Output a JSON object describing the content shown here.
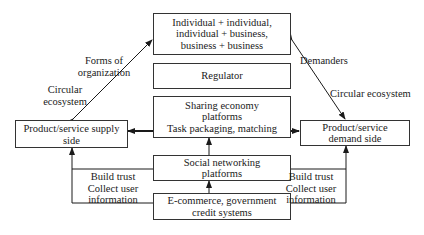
{
  "diagram": {
    "nodes": {
      "forms": {
        "line1": "Individual + individual,",
        "line2": "individual + business,",
        "line3": "business + business"
      },
      "regulator": {
        "label": "Regulator"
      },
      "sharing": {
        "line1": "Sharing economy",
        "line2": "platforms",
        "line3": "Task packaging, matching"
      },
      "social": {
        "line1": "Social networking",
        "line2": "platforms"
      },
      "ecommerce": {
        "line1": "E-commerce, government",
        "line2": "credit systems"
      },
      "supply": {
        "line1": "Product/service supply",
        "line2": "side"
      },
      "demand": {
        "line1": "Product/service",
        "line2": "demand side"
      }
    },
    "edge_labels": {
      "forms_of_org": {
        "line1": "Forms of",
        "line2": "organization"
      },
      "circular_left": {
        "line1": "Circular",
        "line2": "ecosystem"
      },
      "demanders": "Demanders",
      "circular_right": "Circular ecosystem",
      "left_bottom": {
        "line1": "Build trust",
        "line2": "Collect user",
        "line3": "information"
      },
      "right_bottom": {
        "line1": "Build trust",
        "line2": "Collect user",
        "line3": "information"
      }
    },
    "colors": {
      "line": "#1a1a1a",
      "border": "#333333",
      "background": "#ffffff"
    }
  }
}
